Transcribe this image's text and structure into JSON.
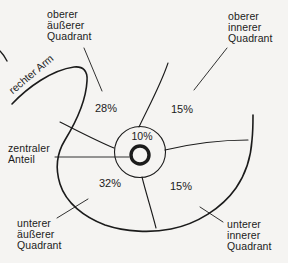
{
  "diagram": {
    "regions": {
      "upper_outer": {
        "label_lines": [
          "oberer",
          "äußerer",
          "Quadrant"
        ],
        "percent": "28%"
      },
      "upper_inner": {
        "label_lines": [
          "oberer",
          "innerer",
          "Quadrant"
        ],
        "percent": "15%"
      },
      "lower_outer": {
        "label_lines": [
          "unterer",
          "äußerer",
          "Quadrant"
        ],
        "percent": "32%"
      },
      "lower_inner": {
        "label_lines": [
          "unterer",
          "innerer",
          "Quadrant"
        ],
        "percent": "15%"
      },
      "central": {
        "label_lines": [
          "zentraler",
          "Anteil"
        ],
        "percent": "10%"
      }
    },
    "arm_label": "rechter Arm",
    "colors": {
      "line": "#1b1b1b",
      "text": "#1b1b1b",
      "background": "#f5f4f2"
    }
  }
}
